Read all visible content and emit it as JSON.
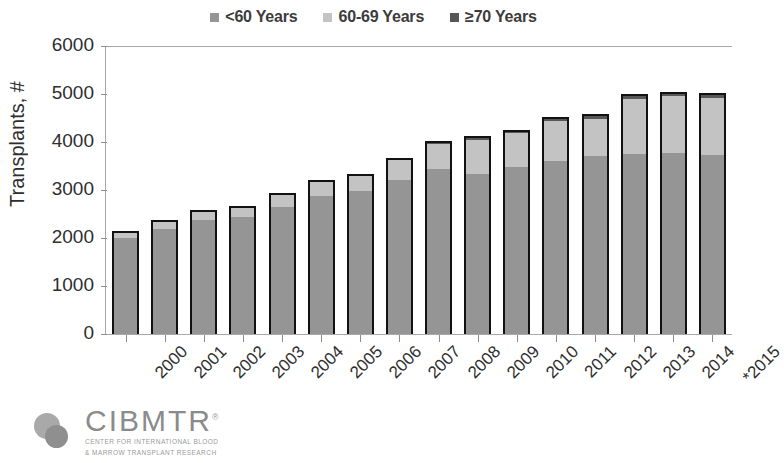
{
  "legend": {
    "items": [
      {
        "label": "<60 Years",
        "color": "#959595",
        "key": "lt60"
      },
      {
        "label": "60-69 Years",
        "color": "#c3c3c3",
        "key": "a6069"
      },
      {
        "label": "≥70 Years",
        "color": "#575757",
        "key": "ge70"
      }
    ]
  },
  "axes": {
    "ylabel": "Transplants, #",
    "yticks": [
      6000,
      5000,
      4000,
      3000,
      2000,
      1000,
      0
    ],
    "ymin": 0,
    "ymax": 6000
  },
  "logo": {
    "word": "CIBMTR",
    "trademark": "®",
    "sub_line1": "CENTER FOR INTERNATIONAL BLOOD",
    "sub_line2": "& MARROW TRANSPLANT RESEARCH"
  },
  "chart_data": {
    "type": "bar",
    "stacked": true,
    "title": "",
    "subtitle": "",
    "xlabel": "",
    "ylabel": "Transplants, #",
    "ylim": [
      0,
      6000
    ],
    "ytick_step": 1000,
    "grid": false,
    "legend_position": "top-center",
    "annotations": [
      "*2015 data are preliminary"
    ],
    "categories": [
      "2000",
      "2001",
      "2002",
      "2003",
      "2004",
      "2005",
      "2006",
      "2007",
      "2008",
      "2009",
      "2010",
      "2011",
      "2012",
      "2013",
      "2014",
      "*2015"
    ],
    "series": [
      {
        "name": "<60 Years",
        "color": "#959595",
        "values": [
          1990,
          2185,
          2370,
          2440,
          2650,
          2880,
          2980,
          3210,
          3440,
          3330,
          3480,
          3600,
          3700,
          3750,
          3780,
          3720
        ]
      },
      {
        "name": "60-69 Years",
        "color": "#c3c3c3",
        "values": [
          110,
          150,
          170,
          190,
          250,
          290,
          320,
          420,
          520,
          710,
          700,
          830,
          790,
          1140,
          1170,
          1200
        ]
      },
      {
        "name": "≥70 Years",
        "color": "#575757",
        "values": [
          20,
          15,
          20,
          20,
          20,
          30,
          30,
          40,
          60,
          80,
          70,
          100,
          90,
          110,
          90,
          110
        ]
      }
    ],
    "totals": [
      2120,
      2350,
      2560,
      2650,
      2920,
      3200,
      3330,
      3670,
      4020,
      4120,
      4250,
      4530,
      4580,
      5000,
      5040,
      5030
    ]
  }
}
